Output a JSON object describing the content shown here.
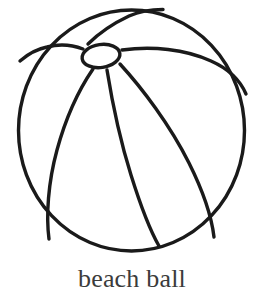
{
  "page": {
    "background_color": "#ffffff",
    "width": 264,
    "height": 300
  },
  "illustration": {
    "title": "beach ball",
    "style": "black-and-white line drawing",
    "stroke_color": "#1a1a1a",
    "fill_color": "#ffffff",
    "stroke_width": 3,
    "shapes": {
      "outline_circle": {
        "name": "ball-outline",
        "cx": 131.5,
        "cy": 130.5,
        "rx": 113,
        "ry": 120.5
      },
      "hub_ellipse": {
        "name": "ball-hub",
        "cx": 101,
        "cy": 56,
        "rx": 19,
        "ry": 11.5,
        "rotation": -8
      },
      "seams": [
        {
          "name": "seam-left-horizontal",
          "path": "M 83 49 C 70 44 58 44 47 47 C 37 49 28 54 20 61"
        },
        {
          "name": "seam-upper-left",
          "path": "M 88 44 C 98 34 112 24 129 16 C 140 11 152 9 163 9"
        },
        {
          "name": "seam-upper-right",
          "path": "M 122 50 C 152 46 185 49 211 61 C 229 69 240 80 246 93"
        },
        {
          "name": "seam-lower-left",
          "path": "M 93 69 C 80 88 66 117 57 150 C 48 183 46 215 49 238"
        },
        {
          "name": "seam-lower-center",
          "path": "M 108 70 C 112 100 120 140 131 175 C 141 207 151 231 159 245"
        },
        {
          "name": "seam-lower-right",
          "path": "M 120 64 C 142 88 170 125 189 163 C 204 193 212 219 214 236"
        }
      ]
    }
  },
  "caption": {
    "text": "beach ball",
    "color": "#3b3b3b",
    "align": "center"
  }
}
